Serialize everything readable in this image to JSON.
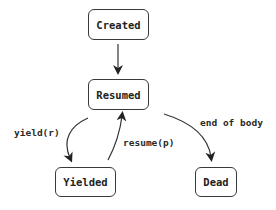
{
  "diagram": {
    "type": "state-machine",
    "nodes": [
      {
        "id": "created",
        "label": "Created"
      },
      {
        "id": "resumed",
        "label": "Resumed"
      },
      {
        "id": "yielded",
        "label": "Yielded"
      },
      {
        "id": "dead",
        "label": "Dead"
      }
    ],
    "edges": [
      {
        "from": "created",
        "to": "resumed",
        "label": ""
      },
      {
        "from": "resumed",
        "to": "yielded",
        "label": "yield(r)"
      },
      {
        "from": "yielded",
        "to": "resumed",
        "label": "resume(p)"
      },
      {
        "from": "resumed",
        "to": "dead",
        "label": "end of body"
      }
    ],
    "colors": {
      "stroke": "#3a3a3a",
      "text": "#222222",
      "background": "#ffffff"
    }
  }
}
